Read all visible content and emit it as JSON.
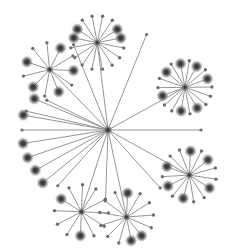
{
  "diagram": {
    "type": "radial-tree",
    "colors": {
      "edge": "#8a8a8a",
      "node": "#3a3a3a",
      "halo": "#6e6e6e",
      "background": "#ffffff"
    },
    "root": {
      "id": "root",
      "clusters": [
        {
          "id": "c-top",
          "dir": 263,
          "dist": 88,
          "leaves": 16,
          "bigLeaves": [
            5,
            6,
            11,
            12
          ]
        },
        {
          "id": "c-upper-left",
          "dir": 226,
          "dist": 84,
          "leaves": 11,
          "bigLeaves": [
            0,
            2,
            4,
            7,
            9
          ]
        },
        {
          "id": "c-right-upper",
          "dir": 331,
          "dist": 88,
          "leaves": 18,
          "bigLeaves": [
            0,
            3,
            6,
            8,
            10,
            12,
            16
          ]
        },
        {
          "id": "c-right-lower",
          "dir": 29,
          "dist": 93,
          "leaves": 15,
          "bigLeaves": [
            1,
            4,
            6,
            8,
            11,
            13
          ]
        },
        {
          "id": "c-bottom-left",
          "dir": 108,
          "dist": 86,
          "leaves": 12,
          "bigLeaves": [
            2,
            6
          ]
        },
        {
          "id": "c-bottom",
          "dir": 78,
          "dist": 89,
          "leaves": 13,
          "bigLeaves": [
            1,
            2,
            9
          ]
        }
      ],
      "leaves": [
        {
          "id": "l1",
          "dir": 206,
          "dist": 68,
          "big": false
        },
        {
          "id": "l2",
          "dir": 203,
          "dist": 80,
          "big": true
        },
        {
          "id": "l3",
          "dir": 193,
          "dist": 84,
          "big": false
        },
        {
          "id": "l4",
          "dir": 190,
          "dist": 86,
          "big": true
        },
        {
          "id": "l5",
          "dir": 180,
          "dist": 86,
          "big": false
        },
        {
          "id": "l6",
          "dir": 171,
          "dist": 86,
          "big": true
        },
        {
          "id": "l7",
          "dir": 161,
          "dist": 85,
          "big": true
        },
        {
          "id": "l8",
          "dir": 151,
          "dist": 83,
          "big": true
        },
        {
          "id": "l9",
          "dir": 141,
          "dist": 84,
          "big": true
        },
        {
          "id": "l10",
          "dir": 132,
          "dist": 75,
          "big": false
        },
        {
          "id": "l11",
          "dir": 92,
          "dist": 70,
          "big": false
        },
        {
          "id": "l12",
          "dir": 248,
          "dist": 92,
          "big": false
        },
        {
          "id": "l13",
          "dir": 292,
          "dist": 103,
          "big": false
        },
        {
          "id": "l14",
          "dir": 0,
          "dist": 93,
          "big": false
        },
        {
          "id": "l15",
          "dir": 48,
          "dist": 78,
          "big": false
        }
      ]
    }
  }
}
